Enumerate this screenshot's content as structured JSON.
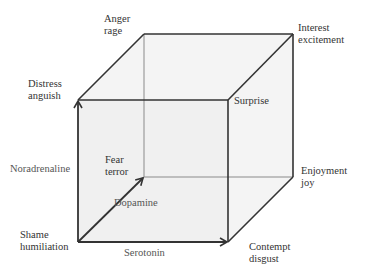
{
  "diagram": {
    "axes": {
      "x": "Serotonin",
      "y": "Noradrenaline",
      "z": "Dopamine"
    },
    "vertices": {
      "origin": {
        "line1": "Shame",
        "line2": "humiliation"
      },
      "x": {
        "line1": "Contempt",
        "line2": "disgust"
      },
      "y": {
        "line1": "Distress",
        "line2": "anguish"
      },
      "z": {
        "line1": "Fear",
        "line2": "terror"
      },
      "xy": {
        "line1": "Surprise"
      },
      "xz": {
        "line1": "Enjoyment",
        "line2": "joy"
      },
      "yz": {
        "line1": "Anger",
        "line2": "rage"
      },
      "xyz": {
        "line1": "Interest",
        "line2": "excitement"
      }
    },
    "colors": {
      "edge": "#333333",
      "hidden_edge": "#8a8a8a",
      "fill": "#f2f2f2",
      "text": "#333333"
    }
  }
}
